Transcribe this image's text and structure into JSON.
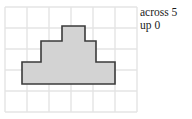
{
  "figure": {
    "name": "grid-shape-figure",
    "grid": {
      "columns": 6,
      "rows": 5,
      "cell_size": 22,
      "origin_x": 5,
      "origin_y": 7,
      "line_color": "#e2e2e2",
      "border_color": "#dddddd"
    },
    "shape": {
      "name": "stepped-pyramid-polygon",
      "fill_color": "#d3d3d3",
      "stroke_color": "#3b3b3b",
      "stroke_width": 1.6,
      "points": "22,62 22,84 115,84 115,62 96,62 96,41 85,41 85,26 62,26 62,41 41,41 41,62"
    }
  },
  "labels": {
    "across": "across 5",
    "up": "up 0"
  }
}
